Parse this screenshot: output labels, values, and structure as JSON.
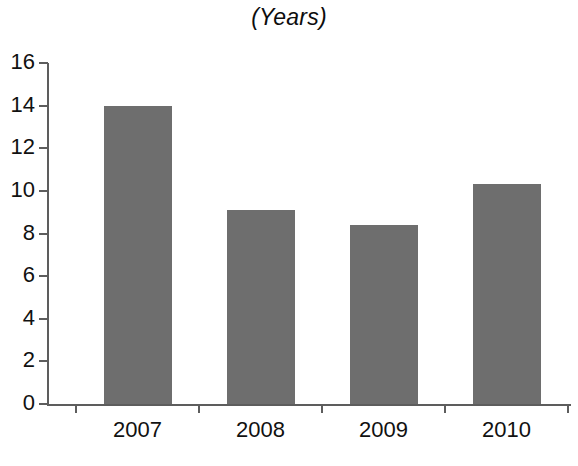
{
  "chart_data": {
    "type": "bar",
    "title": "(Years)",
    "subtitle": "",
    "xlabel": "",
    "ylabel": "",
    "categories": [
      "2007",
      "2008",
      "2009",
      "2010"
    ],
    "values": [
      14.0,
      9.1,
      8.4,
      10.3
    ],
    "series": [
      {
        "name": "Years",
        "values": [
          14.0,
          9.1,
          8.4,
          10.3
        ]
      }
    ],
    "ylim": [
      0,
      16
    ],
    "ytick_values": [
      0,
      2,
      4,
      6,
      8,
      10,
      12,
      14,
      16
    ],
    "ytick_labels": [
      "0",
      "2",
      "4",
      "6",
      "8",
      "10",
      "12",
      "14",
      "16"
    ],
    "grid": false,
    "legend": false,
    "legend_position": "none",
    "bar_color": "#6e6e6e",
    "axis_color": "#5d5d5d",
    "background_color": "#ffffff",
    "annotations": []
  }
}
